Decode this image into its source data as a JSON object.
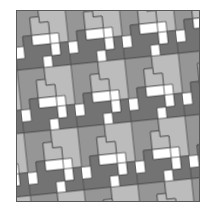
{
  "figure": {
    "colors": {
      "dark": "#737373",
      "mid": "#969696",
      "light": "#bcbcbc",
      "white": "#ffffff",
      "edge": "#4a4a4a",
      "frame": "#5a5a5a"
    },
    "rotation_deg": -6,
    "tile_period_px": 54,
    "band_height_px": 63
  }
}
